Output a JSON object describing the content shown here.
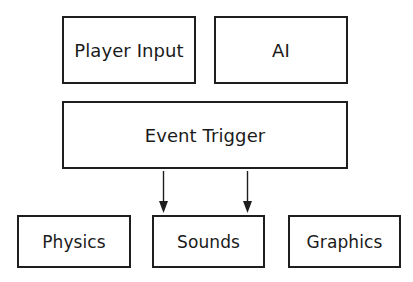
{
  "diagram": {
    "nodes": {
      "player_input": {
        "label": "Player Input"
      },
      "ai": {
        "label": "AI"
      },
      "event_trigger": {
        "label": "Event Trigger"
      },
      "physics": {
        "label": "Physics"
      },
      "sounds": {
        "label": "Sounds"
      },
      "graphics": {
        "label": "Graphics"
      }
    },
    "edges": [
      {
        "from": "event_trigger",
        "to": "sounds",
        "style": "arrow"
      },
      {
        "from": "event_trigger",
        "to": "sounds",
        "style": "arrow"
      }
    ],
    "colors": {
      "stroke": "#1e1e1e",
      "background": "#ffffff",
      "text": "#1a1a1a"
    }
  }
}
